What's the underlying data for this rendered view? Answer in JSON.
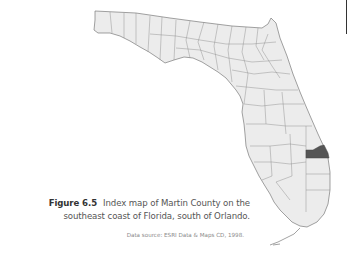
{
  "figure": {
    "label": "Figure 6.5",
    "caption_line1": "Index map of Martin County on the",
    "caption_line2": "southeast coast of Florida, south of Orlando.",
    "source": "Data source: ESRI Data & Maps CD, 1998."
  },
  "map": {
    "region": "Florida",
    "subdivision": "counties",
    "highlighted_county": "Martin County",
    "colors": {
      "land": "#ececec",
      "boundary": "#8a8a8a",
      "highlight": "#555555",
      "background": "#ffffff"
    }
  }
}
